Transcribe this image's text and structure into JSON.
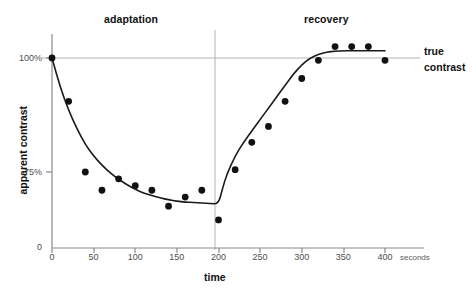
{
  "figure": {
    "background_color": "#ffffff",
    "line_color": "#1a1a1a",
    "point_color": "#111111",
    "grid_color": "#b0b0b0",
    "axis_color": "#8a8a8a"
  },
  "labels": {
    "phase_adaptation": "adaptation",
    "phase_recovery": "recovery",
    "annotation_true": "true",
    "annotation_contrast": "contrast"
  },
  "chart_data": {
    "type": "scatter",
    "title": "",
    "subtitle": "",
    "xlabel": "time",
    "ylabel": "apparent contrast",
    "xunit": "seconds",
    "xlim": [
      0,
      400
    ],
    "ylim": [
      0,
      108
    ],
    "grid": false,
    "legend_position": "none",
    "xticks": [
      0,
      50,
      100,
      150,
      200,
      250,
      300,
      350,
      400
    ],
    "xtick_labels": [
      "0",
      "50",
      "100",
      "150",
      "200",
      "250",
      "300",
      "350",
      "400"
    ],
    "yticks": [
      0,
      75,
      100
    ],
    "ytick_labels": [
      "0",
      "75%",
      "100%"
    ],
    "reference_lines": [
      {
        "name": "true-contrast-line",
        "orientation": "horizontal",
        "value": 100,
        "label": "true contrast"
      },
      {
        "name": "phase-divider-line",
        "orientation": "vertical",
        "value": 200,
        "label": ""
      }
    ],
    "annotations": [
      {
        "text": "adaptation",
        "x": 100,
        "y": 108
      },
      {
        "text": "recovery",
        "x": 320,
        "y": 108
      },
      {
        "text": "true contrast",
        "x": 410,
        "y": 100
      }
    ],
    "series": [
      {
        "name": "measured apparent contrast",
        "marker": "filled-circle",
        "x": [
          0,
          20,
          40,
          60,
          80,
          100,
          120,
          140,
          160,
          180,
          200,
          220,
          240,
          260,
          280,
          300,
          320,
          340,
          360,
          380,
          400
        ],
        "y": [
          100,
          90.5,
          75,
          71,
          73.5,
          72,
          71,
          67.5,
          69.5,
          71,
          64.5,
          75.5,
          81.5,
          85,
          90.5,
          95.5,
          99.5,
          102.5,
          102.5,
          102.5,
          99.5
        ]
      },
      {
        "name": "fitted curve",
        "marker": "none",
        "x": [
          0,
          10,
          20,
          30,
          40,
          50,
          60,
          70,
          80,
          90,
          100,
          110,
          120,
          130,
          140,
          150,
          160,
          170,
          180,
          190,
          200,
          205,
          210,
          220,
          230,
          240,
          250,
          260,
          270,
          280,
          290,
          300,
          310,
          320,
          330,
          340,
          350,
          360,
          370,
          380,
          390,
          400
        ],
        "y": [
          100,
          93.5,
          88.5,
          84.5,
          81,
          78.5,
          76.5,
          74.8,
          73.4,
          72.2,
          71.2,
          70.4,
          69.8,
          69.3,
          68.9,
          68.6,
          68.4,
          68.3,
          68.2,
          68.1,
          68.0,
          71.5,
          74.5,
          78.5,
          81.5,
          84.0,
          86.5,
          89.0,
          91.5,
          94.0,
          96.5,
          98.5,
          100.0,
          100.8,
          101.3,
          101.5,
          101.6,
          101.6,
          101.6,
          101.6,
          101.6,
          101.6
        ]
      }
    ]
  }
}
